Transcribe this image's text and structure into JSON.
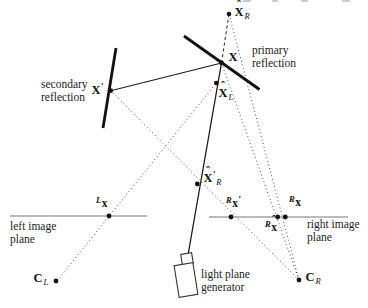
{
  "figure": {
    "colors": {
      "line_black": "#1a1a1a",
      "mirror_black": "#111111",
      "image_plane_gray": "#a3a3a3",
      "dotted_ray_gray": "#4a4a4a",
      "dot_black": "#111111",
      "background": "#ffffff"
    },
    "labels": {
      "xhat_r": {
        "hat": "ˆ",
        "main": "X",
        "sub": "R"
      },
      "x": {
        "main": "X"
      },
      "xhat_l": {
        "hat": "ˆ",
        "main": "X",
        "sub": "L"
      },
      "x_prime": {
        "main": "X",
        "prime": "′"
      },
      "xhat_prime_r": {
        "hat": "ˆ",
        "main": "X",
        "prime": "′",
        "sub": "R"
      },
      "lx": {
        "sup": "L",
        "main": "x"
      },
      "rx_prime": {
        "sup": "R",
        "main": "x",
        "prime": "′"
      },
      "rxhat": {
        "sup": "R",
        "hat": "ˆ",
        "main": "x"
      },
      "rx": {
        "sup": "R",
        "main": "x"
      },
      "c_l": {
        "main": "C",
        "sub": "L"
      },
      "c_r": {
        "main": "C",
        "sub": "R"
      }
    },
    "annotations": {
      "secondary_reflection": {
        "line1": "secondary",
        "line2": "reflection"
      },
      "primary_reflection": {
        "line1": "primary",
        "line2": "reflection"
      },
      "left_image_plane": {
        "line1": "left image",
        "line2": "plane"
      },
      "right_image_plane": {
        "line1": "right image",
        "line2": "plane"
      },
      "light_plane_generator": {
        "line1": "light plane",
        "line2": "generator"
      }
    }
  }
}
